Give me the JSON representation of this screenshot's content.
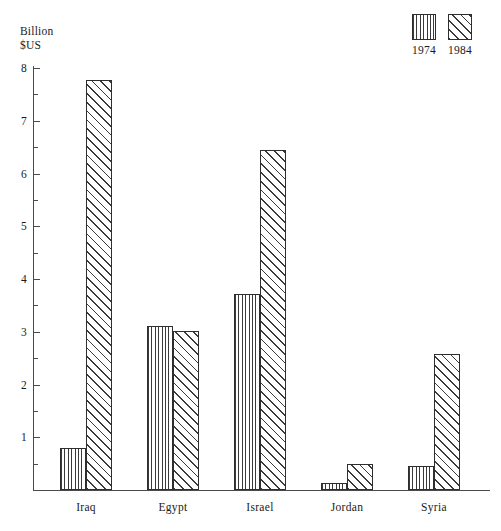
{
  "chart_data": {
    "type": "bar",
    "title": "",
    "subtitle": "",
    "ylabel_line1": "Billion",
    "ylabel_line2": "$US",
    "xlabel": "",
    "categories": [
      "Iraq",
      "Egypt",
      "Israel",
      "Jordan",
      "Syria"
    ],
    "series": [
      {
        "name": "1974",
        "pattern": "vertical-lines",
        "values": [
          0.8,
          3.1,
          3.72,
          0.13,
          0.46
        ]
      },
      {
        "name": "1984",
        "pattern": "diagonal-hatch",
        "values": [
          7.77,
          3.02,
          6.45,
          0.49,
          2.57
        ]
      }
    ],
    "ylim": [
      0,
      8
    ],
    "ytick_labels": [
      "8",
      "7",
      "6",
      "5",
      "4",
      "3",
      "2",
      "1"
    ],
    "ytick_values": [
      8,
      7,
      6,
      5,
      4,
      3,
      2,
      1
    ],
    "yminor_step": 0.5,
    "grid": false,
    "legend": {
      "position": "top-right",
      "entries": [
        "1974",
        "1984"
      ]
    },
    "colors": {
      "ink": "#2e2e2e",
      "axis": "#4a4a4a",
      "background": "#ffffff"
    }
  }
}
